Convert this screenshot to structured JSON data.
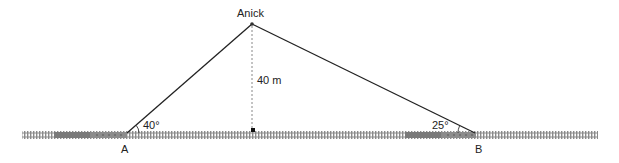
{
  "diagram": {
    "observer_label": "Anick",
    "height_label": "40 m",
    "angle_a_label": "40°",
    "angle_b_label": "25°",
    "point_a_label": "A",
    "point_b_label": "B",
    "colors": {
      "line": "#222222",
      "track": "#8a8a8a",
      "train": "#7a7a7a"
    }
  }
}
